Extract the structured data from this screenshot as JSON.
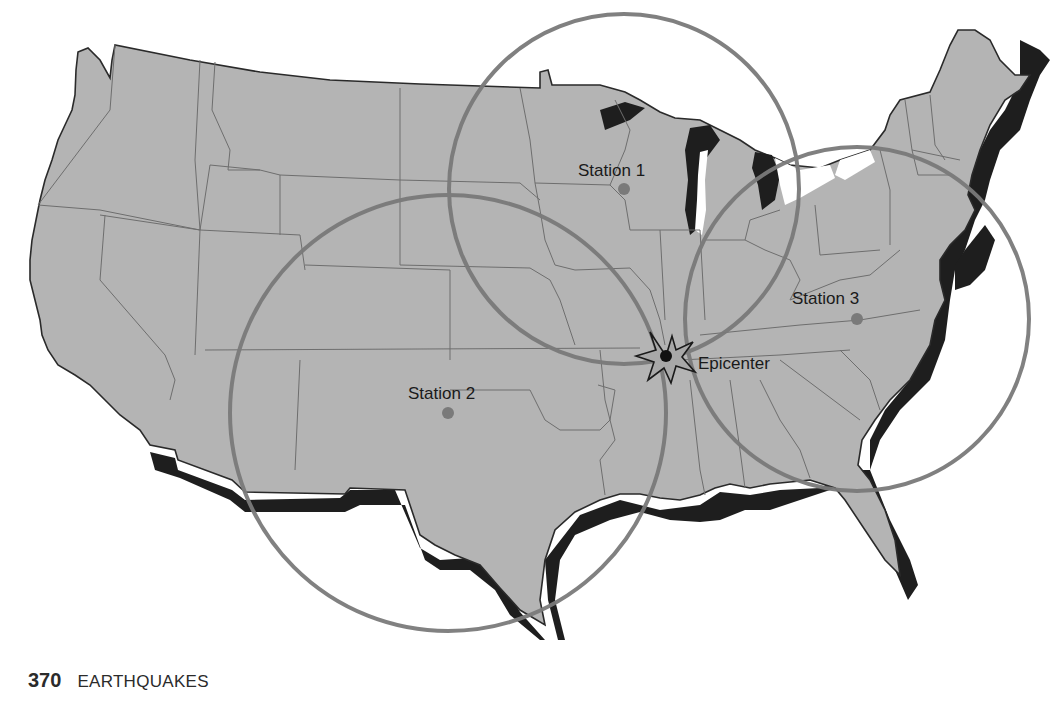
{
  "figure": {
    "colors": {
      "land": "#b4b4b4",
      "land_shadow": "#1e1e1e",
      "state_lines": "#6e6e6e",
      "outline": "#2a2a2a",
      "circle": "#7a7a7a",
      "station_dot": "#7a7a7a",
      "epicenter_star": "#a8a8a8",
      "background": "#ffffff"
    },
    "stations": [
      {
        "label": "Station 1",
        "x": 624,
        "y": 189,
        "circle_r": 175
      },
      {
        "label": "Station 2",
        "x": 448,
        "y": 413,
        "circle_r": 218
      },
      {
        "label": "Station 3",
        "x": 857,
        "y": 319,
        "circle_r": 172
      }
    ],
    "epicenter": {
      "label": "Epicenter",
      "x": 666,
      "y": 356
    }
  },
  "page_footer": {
    "page_number": "370",
    "section": "EARTHQUAKES"
  }
}
